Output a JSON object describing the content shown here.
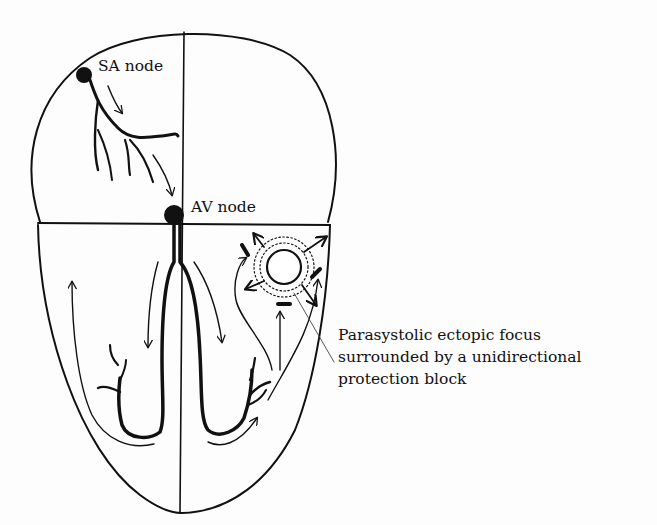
{
  "diagram": {
    "type": "heart-conduction-schematic",
    "labels": {
      "sa_node": "SA node",
      "av_node": "AV node",
      "ectopic_focus": [
        "Parasystolic ectopic focus",
        "surrounded by a unidirectional",
        "protection block"
      ]
    },
    "colors": {
      "ink": "#111111",
      "background": "#fdfdfd"
    }
  }
}
